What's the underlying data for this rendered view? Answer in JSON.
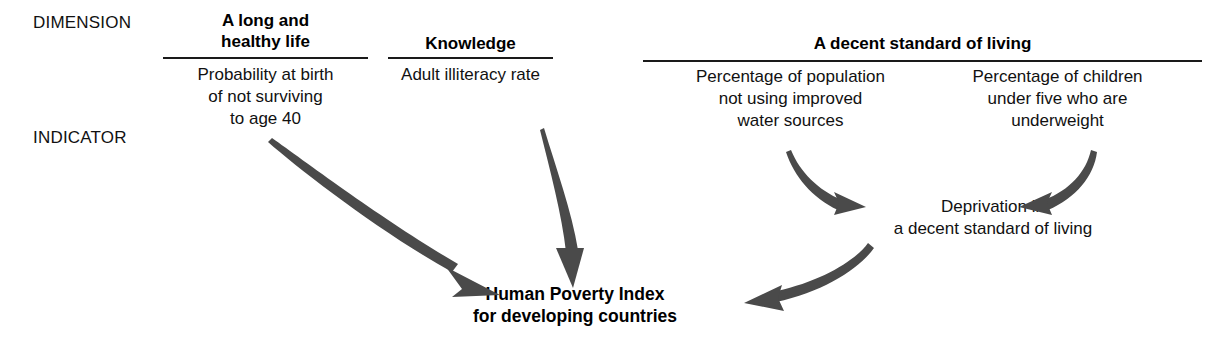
{
  "figure": {
    "row_labels": {
      "dimension": "DIMENSION",
      "indicator": "INDICATOR"
    },
    "dimensions": [
      {
        "id": "health",
        "title": "A long and\nhealthy life"
      },
      {
        "id": "knowledge",
        "title": "Knowledge"
      },
      {
        "id": "living",
        "title": "A decent standard of living"
      }
    ],
    "indicators": [
      {
        "id": "mortality",
        "text": "Probability at birth\nof not surviving\nto age 40"
      },
      {
        "id": "illiteracy",
        "text": "Adult illiteracy rate"
      },
      {
        "id": "water",
        "text": "Percentage of population\nnot using improved\nwater sources"
      },
      {
        "id": "underweight",
        "text": "Percentage of children\nunder five who are\nunderweight"
      }
    ],
    "nodes": [
      {
        "id": "deprivation",
        "text": "Deprivation in\na decent standard of living"
      },
      {
        "id": "hpi",
        "text": "Human Poverty Index\nfor developing countries"
      }
    ],
    "edges": [
      {
        "id": "mortality-to-hpi",
        "from": "mortality",
        "to": "hpi"
      },
      {
        "id": "illiteracy-to-hpi",
        "from": "illiteracy",
        "to": "hpi"
      },
      {
        "id": "water-to-deprivation",
        "from": "water",
        "to": "deprivation"
      },
      {
        "id": "underweight-to-deprivation",
        "from": "underweight",
        "to": "deprivation"
      },
      {
        "id": "deprivation-to-hpi",
        "from": "deprivation",
        "to": "hpi"
      }
    ],
    "colors": {
      "background": "#ffffff",
      "text": "#111111",
      "rule": "#1a1a1a",
      "arrow": "#4a4a4a"
    }
  }
}
